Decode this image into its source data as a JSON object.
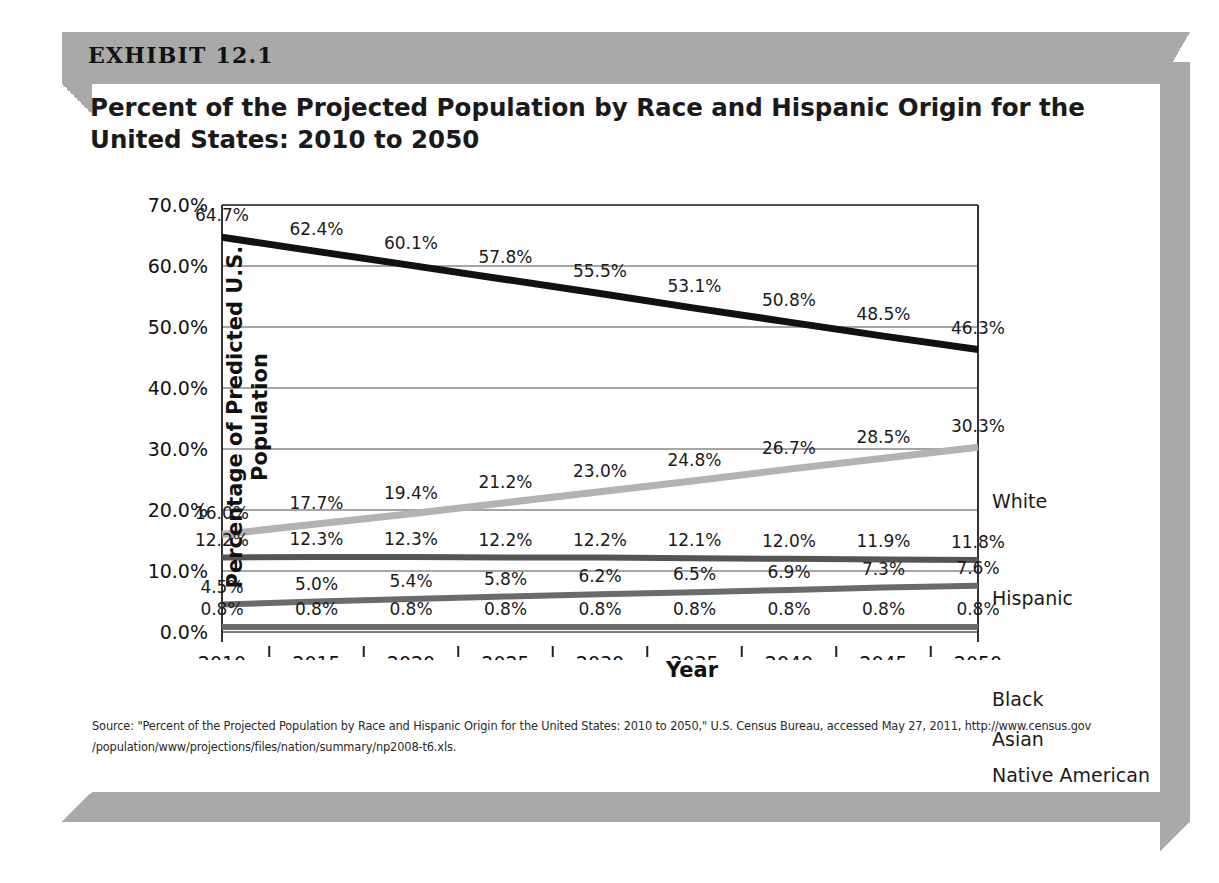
{
  "exhibit": {
    "label": "EXHIBIT 12.1",
    "title": "Percent of the Projected Population by Race and Hispanic Origin for the United States: 2010 to 2050",
    "source": "Source: \"Percent of the Projected Population by Race and Hispanic Origin for the United States:  2010 to 2050,\" U.S. Census Bureau, accessed May 27, 2011, http://www.census.gov /population/www/projections/files/nation/summary/np2008-t6.xls."
  },
  "chart_data": {
    "type": "line",
    "title": "Percent of the Projected Population by Race and Hispanic Origin for the United States: 2010 to 2050",
    "xlabel": "Year",
    "ylabel": "Percentage of Predicted U.S. Population",
    "categories": [
      "2010",
      "2015",
      "2020",
      "2025",
      "2030",
      "2035",
      "2040",
      "2045",
      "2050"
    ],
    "ylim": [
      0,
      70
    ],
    "ytick_labels": [
      "0.0%",
      "10.0%",
      "20.0%",
      "30.0%",
      "40.0%",
      "50.0%",
      "60.0%",
      "70.0%"
    ],
    "ytick_values": [
      0,
      10,
      20,
      30,
      40,
      50,
      60,
      70
    ],
    "grid": true,
    "legend_position": "right-of-plot-at-series-end",
    "series": [
      {
        "name": "White",
        "color": "#111111",
        "values": [
          64.7,
          62.4,
          60.1,
          57.8,
          55.5,
          53.1,
          50.8,
          48.5,
          46.3
        ],
        "labels": [
          "64.7%",
          "62.4%",
          "60.1%",
          "57.8%",
          "55.5%",
          "53.1%",
          "50.8%",
          "48.5%",
          "46.3%"
        ]
      },
      {
        "name": "Hispanic",
        "color": "#b3b3b3",
        "values": [
          16.0,
          17.7,
          19.4,
          21.2,
          23.0,
          24.8,
          26.7,
          28.5,
          30.3
        ],
        "labels": [
          "16.0%",
          "17.7%",
          "19.4%",
          "21.2%",
          "23.0%",
          "24.8%",
          "26.7%",
          "28.5%",
          "30.3%"
        ]
      },
      {
        "name": "Black",
        "color": "#555555",
        "values": [
          12.2,
          12.3,
          12.3,
          12.2,
          12.2,
          12.1,
          12.0,
          11.9,
          11.8
        ],
        "labels": [
          "12.2%",
          "12.3%",
          "12.3%",
          "12.2%",
          "12.2%",
          "12.1%",
          "12.0%",
          "11.9%",
          "11.8%"
        ]
      },
      {
        "name": "Asian",
        "color": "#6b6b6b",
        "values": [
          4.5,
          5.0,
          5.4,
          5.8,
          6.2,
          6.5,
          6.9,
          7.3,
          7.6
        ],
        "labels": [
          "4.5%",
          "5.0%",
          "5.4%",
          "5.8%",
          "6.2%",
          "6.5%",
          "6.9%",
          "7.3%",
          "7.6%"
        ]
      },
      {
        "name": "Native American",
        "color": "#6b6b6b",
        "values": [
          0.8,
          0.8,
          0.8,
          0.8,
          0.8,
          0.8,
          0.8,
          0.8,
          0.8
        ],
        "labels": [
          "0.8%",
          "0.8%",
          "0.8%",
          "0.8%",
          "0.8%",
          "0.8%",
          "0.8%",
          "0.8%",
          "0.8%"
        ]
      }
    ]
  },
  "legend": [
    {
      "label": "White",
      "top": 330
    },
    {
      "label": "Hispanic",
      "top": 427
    },
    {
      "label": "Black",
      "top": 528
    },
    {
      "label": "Asian",
      "top": 568
    },
    {
      "label": "Native American",
      "top": 604
    }
  ]
}
